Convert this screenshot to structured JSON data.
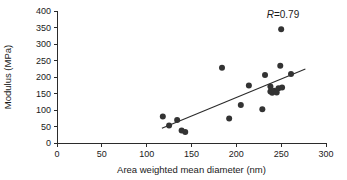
{
  "chart_data": {
    "type": "scatter",
    "title": "",
    "subtitle": "",
    "xlabel": "Area weighted mean diameter (nm)",
    "ylabel": "Modulus (MPa)",
    "xlim": [
      0,
      300
    ],
    "ylim": [
      0,
      400
    ],
    "xticks": [
      0,
      50,
      100,
      150,
      200,
      250,
      300
    ],
    "yticks": [
      0,
      50,
      100,
      150,
      200,
      250,
      300,
      350,
      400
    ],
    "xtick_labels": [
      "0",
      "50",
      "100",
      "150",
      "200",
      "250",
      "300"
    ],
    "ytick_labels": [
      "0",
      "50",
      "100",
      "150",
      "200",
      "250",
      "300",
      "350",
      "400"
    ],
    "grid": false,
    "legend": null,
    "marker": {
      "shape": "circle",
      "color": "#333333",
      "size_px": 3.0
    },
    "points": [
      {
        "x": 118,
        "y": 80
      },
      {
        "x": 125,
        "y": 53
      },
      {
        "x": 134,
        "y": 70
      },
      {
        "x": 139,
        "y": 38
      },
      {
        "x": 143,
        "y": 33
      },
      {
        "x": 184,
        "y": 228
      },
      {
        "x": 192,
        "y": 74
      },
      {
        "x": 205,
        "y": 115
      },
      {
        "x": 214,
        "y": 174
      },
      {
        "x": 229,
        "y": 102
      },
      {
        "x": 232,
        "y": 206
      },
      {
        "x": 238,
        "y": 171
      },
      {
        "x": 238,
        "y": 156
      },
      {
        "x": 240,
        "y": 152
      },
      {
        "x": 242,
        "y": 158
      },
      {
        "x": 245,
        "y": 153
      },
      {
        "x": 247,
        "y": 166
      },
      {
        "x": 249,
        "y": 234
      },
      {
        "x": 250,
        "y": 345
      },
      {
        "x": 251,
        "y": 168
      },
      {
        "x": 261,
        "y": 209
      }
    ],
    "fit_line": {
      "label": "linear trend",
      "x_start": 117,
      "y_start": 45,
      "x_end": 277,
      "y_end": 224
    },
    "annotations": [
      {
        "name": "correlation",
        "symbol": "R",
        "separator": "=",
        "value": "0.79",
        "text": "R=0.79",
        "x": 252,
        "y": 378
      }
    ]
  },
  "figure": {
    "background_color": "#ffffff",
    "axis_color": "#2b2b2b",
    "text_color": "#1a1a1a"
  }
}
